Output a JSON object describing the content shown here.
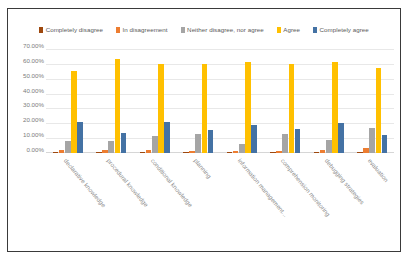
{
  "chart_data": {
    "type": "bar",
    "title": "",
    "xlabel": "",
    "ylabel": "",
    "ylim": [
      0,
      0.7
    ],
    "grid": true,
    "legend_position": "top",
    "ytick_labels": [
      "70.00%",
      "60.00%",
      "50.00%",
      "40.00%",
      "30.00%",
      "20.00%",
      "10.00%",
      "0.00%"
    ],
    "ytick_values": [
      0.7,
      0.6,
      0.5,
      0.4,
      0.3,
      0.2,
      0.1,
      0.0
    ],
    "categories": [
      "declarative knowledge",
      "procedural knowledge",
      "conditional knowledge",
      "planning",
      "information management...",
      "comprehension monitoring",
      "debugging strategies",
      "evaluation"
    ],
    "series": [
      {
        "name": "Completely disagree",
        "color": "#9E480E",
        "values": [
          0.005,
          0.005,
          0.005,
          0.005,
          0.005,
          0.005,
          0.005,
          0.005
        ]
      },
      {
        "name": "In disagreement",
        "color": "#ED7D31",
        "values": [
          0.021,
          0.021,
          0.021,
          0.016,
          0.011,
          0.016,
          0.021,
          0.037
        ]
      },
      {
        "name": "Neither disagree, nor agree",
        "color": "#A5A5A5",
        "values": [
          0.079,
          0.079,
          0.116,
          0.126,
          0.063,
          0.126,
          0.09,
          0.169
        ]
      },
      {
        "name": "Agree",
        "color": "#FFC000",
        "values": [
          0.55,
          0.63,
          0.6,
          0.6,
          0.61,
          0.6,
          0.61,
          0.57
        ]
      },
      {
        "name": "Completely agree",
        "color": "#4472A4",
        "values": [
          0.211,
          0.132,
          0.211,
          0.158,
          0.19,
          0.163,
          0.2,
          0.121
        ]
      }
    ]
  }
}
